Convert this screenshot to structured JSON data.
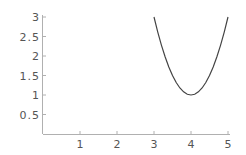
{
  "chart_data": {
    "type": "line",
    "title": "",
    "xlabel": "",
    "ylabel": "",
    "xlim": [
      0,
      5
    ],
    "ylim": [
      0,
      3
    ],
    "grid": false,
    "x_ticks": [
      1,
      2,
      3,
      4,
      5
    ],
    "x_tick_labels": [
      "1",
      "2",
      "3",
      "4",
      "5"
    ],
    "y_ticks": [
      0.5,
      1,
      1.5,
      2,
      2.5,
      3
    ],
    "y_tick_labels": [
      "0.5",
      "1",
      "1.5",
      "2",
      "2.5",
      "3"
    ],
    "series": [
      {
        "name": "f(x) = 2(x-4)^2 + 1",
        "x": [
          3.0,
          3.1,
          3.2,
          3.3,
          3.4,
          3.5,
          3.6,
          3.7,
          3.8,
          3.9,
          4.0,
          4.1,
          4.2,
          4.3,
          4.4,
          4.5,
          4.6,
          4.7,
          4.8,
          4.9,
          5.0
        ],
        "y": [
          3.0,
          2.62,
          2.28,
          1.98,
          1.72,
          1.5,
          1.32,
          1.18,
          1.08,
          1.02,
          1.0,
          1.02,
          1.08,
          1.18,
          1.32,
          1.5,
          1.72,
          1.98,
          2.28,
          2.62,
          3.0
        ],
        "color": "#444444"
      }
    ]
  }
}
